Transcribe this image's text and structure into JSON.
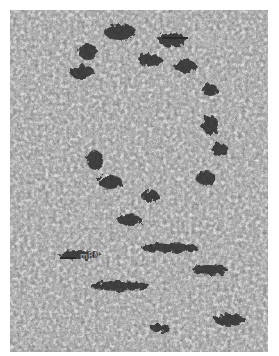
{
  "image": {
    "description": "Electron micrograph showing fibrous grainy texture with dark clusters",
    "colors": {
      "background": "#ffffff",
      "dark": "#2a2a2a",
      "mid": "#8a8a8a",
      "light": "#e8e8e8"
    }
  },
  "labels": {
    "top": {
      "line1": "Loop of",
      "line2": "polysomes"
    },
    "bottom": {
      "line1": "mRNA"
    }
  }
}
